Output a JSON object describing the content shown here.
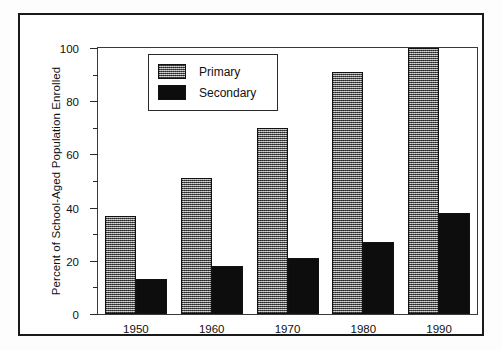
{
  "chart_data": {
    "type": "bar",
    "title": "",
    "xlabel": "",
    "ylabel": "Percent of School-Aged Population Enrolled",
    "categories": [
      "1950",
      "1960",
      "1970",
      "1980",
      "1990"
    ],
    "series": [
      {
        "name": "Primary",
        "values": [
          37,
          51,
          70,
          91,
          100
        ],
        "color": "#7d7d7d",
        "fill": "dithered-gray"
      },
      {
        "name": "Secondary",
        "values": [
          13,
          18,
          21,
          27,
          38
        ],
        "color": "#0d0d0d",
        "fill": "solid-black"
      }
    ],
    "ylim": [
      0,
      100
    ],
    "y_major_ticks": [
      "0",
      "20",
      "40",
      "60",
      "80",
      "100"
    ],
    "y_minor_ticks": [
      10,
      30,
      50,
      70,
      90
    ],
    "grid": false,
    "legend_position": "upper-left-inside",
    "legend_entries": [
      "Primary",
      "Secondary"
    ]
  },
  "legend": {
    "primary_label": "Primary",
    "secondary_label": "Secondary"
  },
  "axes": {
    "y_title": "Percent of School-Aged Population Enrolled"
  }
}
